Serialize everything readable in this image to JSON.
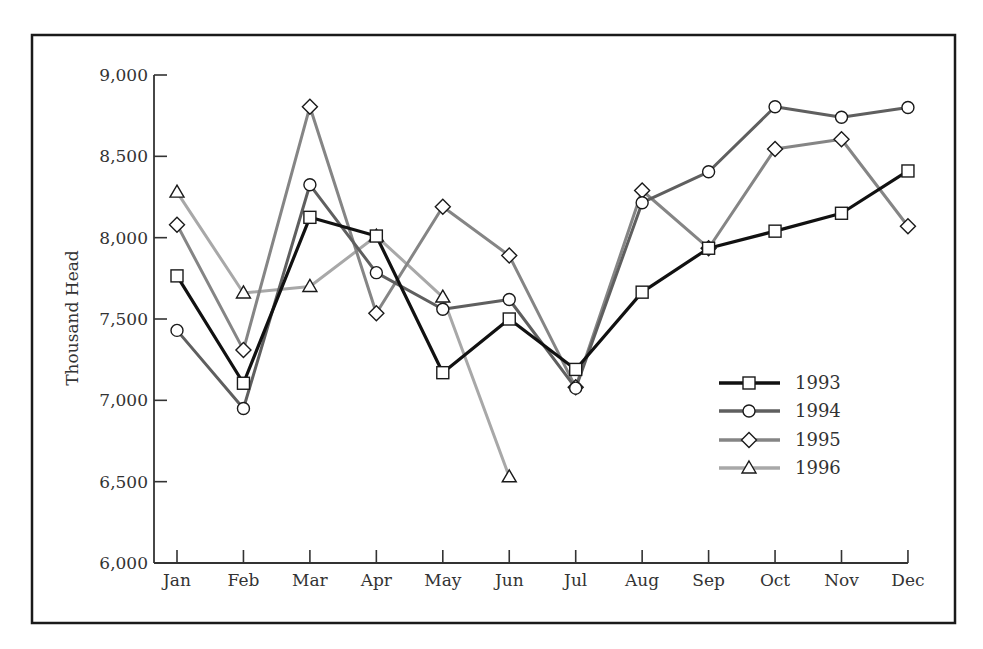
{
  "chart_data": {
    "type": "line",
    "title": "",
    "xlabel": "",
    "ylabel": "Thousand Head",
    "ylim": [
      6000,
      9000
    ],
    "yticks": [
      6000,
      6500,
      7000,
      7500,
      8000,
      8500,
      9000
    ],
    "ytick_labels": [
      "6,000",
      "6,500",
      "7,000",
      "7,500",
      "8,000",
      "8,500",
      "9,000"
    ],
    "categories": [
      "Jan",
      "Feb",
      "Mar",
      "Apr",
      "May",
      "Jun",
      "Jul",
      "Aug",
      "Sep",
      "Oct",
      "Nov",
      "Dec"
    ],
    "grid": false,
    "legend_position": "lower right (inside plot)",
    "series": [
      {
        "name": "1993",
        "marker": "square",
        "color": "#111111",
        "width": 3.2,
        "values": [
          7765,
          7105,
          8125,
          8010,
          7170,
          7500,
          7190,
          7665,
          7935,
          8040,
          8150,
          8410
        ]
      },
      {
        "name": "1994",
        "marker": "circle",
        "color": "#5f5f5f",
        "width": 3,
        "values": [
          7430,
          6950,
          8325,
          7785,
          7560,
          7620,
          7075,
          8215,
          8405,
          8805,
          8740,
          8800
        ]
      },
      {
        "name": "1995",
        "marker": "diamond",
        "color": "#858585",
        "width": 3,
        "values": [
          8080,
          7310,
          8805,
          7535,
          8190,
          7890,
          7080,
          8290,
          7935,
          8545,
          8605,
          8070
        ]
      },
      {
        "name": "1996",
        "marker": "triangle",
        "color": "#a8a8a8",
        "width": 3,
        "values": [
          8280,
          7660,
          7700,
          8010,
          7635,
          6530,
          null,
          null,
          null,
          null,
          null,
          null
        ]
      }
    ]
  }
}
